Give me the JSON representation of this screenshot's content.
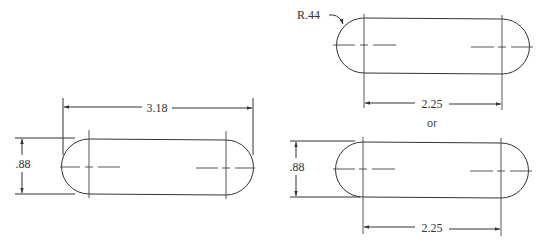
{
  "figure": {
    "left_view": {
      "overall_length_label": "3.18",
      "width_label": ".88"
    },
    "top_right_view": {
      "radius_label": "R.44",
      "center_distance_label": "2.25"
    },
    "separator_label": "or",
    "bottom_right_view": {
      "width_label": ".88",
      "center_distance_label": "2.25"
    }
  }
}
